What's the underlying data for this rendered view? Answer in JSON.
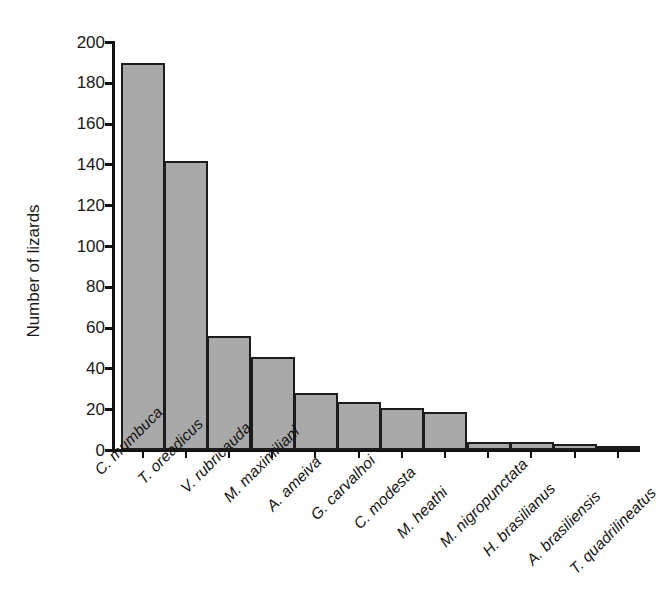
{
  "chart_data": {
    "type": "bar",
    "title": "",
    "subtitle": "",
    "xlabel": "",
    "ylabel": "Number of lizards",
    "ylim": [
      0,
      200
    ],
    "ytick_step": 20,
    "ytick_labels": [
      "200",
      "180",
      "160",
      "140",
      "120",
      "100",
      "80",
      "60",
      "40",
      "20",
      "0"
    ],
    "ytick_values": [
      200,
      180,
      160,
      140,
      120,
      100,
      80,
      60,
      40,
      20,
      0
    ],
    "grid": false,
    "legend": false,
    "legend_position": "none",
    "bar_color": "#a9a9a9",
    "bar_edge_color": "#1c1c1c",
    "axis_color": "#111111",
    "categories": [
      "C. mumbuca",
      "T. oreadicus",
      "V. rubricauda",
      "M. maximiliani",
      "A. ameiva",
      "G. carvalhoi",
      "C. modesta",
      "M. heathi",
      "M. nigropunctata",
      "H. brasilianus",
      "A. brasiliensis",
      "T. quadrilineatus"
    ],
    "values": [
      190,
      142,
      56,
      46,
      28,
      24,
      21,
      19,
      4,
      4,
      3,
      2
    ]
  }
}
